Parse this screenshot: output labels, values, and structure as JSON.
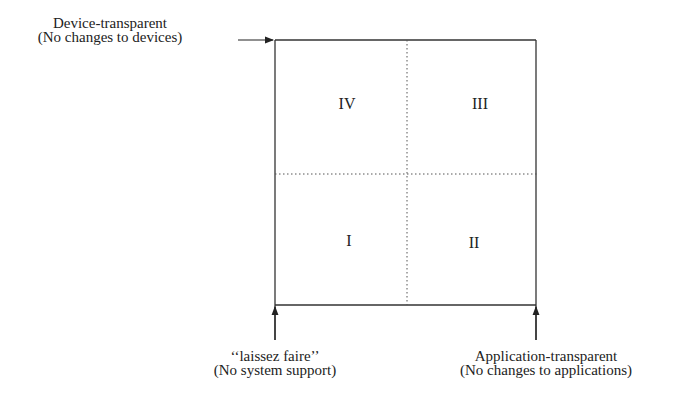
{
  "diagram": {
    "type": "quadrant",
    "axes": {
      "top_left": {
        "title": "Device-transparent",
        "subtitle": "(No changes to devices)"
      },
      "bottom_left": {
        "title": "‘‘laissez faire’’",
        "subtitle": "(No system support)"
      },
      "bottom_right": {
        "title": "Application-transparent",
        "subtitle": "(No changes to applications)"
      }
    },
    "quadrants": [
      {
        "id": "IV",
        "label": "IV",
        "position": "top-left"
      },
      {
        "id": "III",
        "label": "III",
        "position": "top-right"
      },
      {
        "id": "I",
        "label": "I",
        "position": "bottom-left"
      },
      {
        "id": "II",
        "label": "II",
        "position": "bottom-right"
      }
    ]
  }
}
